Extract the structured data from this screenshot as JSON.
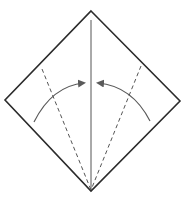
{
  "diagram": {
    "colors": {
      "background": "#ffffff",
      "outline": "#2b2b2b",
      "center_crease": "#555555",
      "dashed_fold": "#555555",
      "arrow": "#5a5a5a"
    },
    "elements": {
      "paper": "square paper rotated 45 degrees (diamond)",
      "center_crease": "vertical crease from top corner to bottom corner",
      "valley_folds": [
        "left valley fold line",
        "right valley fold line"
      ],
      "arrows": [
        "left edge folds to center",
        "right edge folds to center"
      ]
    }
  }
}
